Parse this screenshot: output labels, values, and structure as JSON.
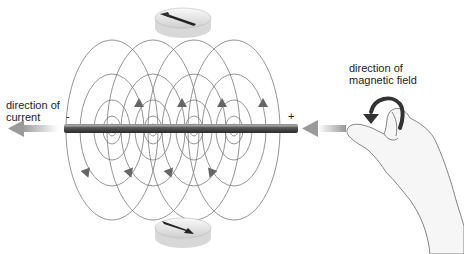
{
  "labels": {
    "current": [
      "direction of",
      "current"
    ],
    "magnetic_field": [
      "direction of",
      "magnetic field"
    ],
    "minus": "-",
    "plus": "+"
  },
  "colors": {
    "wire": "#555555",
    "field_lines": "#777777",
    "arrows": "#6a6a6a",
    "current_arrow": "#9a9a9a"
  },
  "icons": [
    "compass-top",
    "compass-bottom",
    "right-hand",
    "curl-arrow",
    "current-arrow-left",
    "current-arrow-right"
  ]
}
